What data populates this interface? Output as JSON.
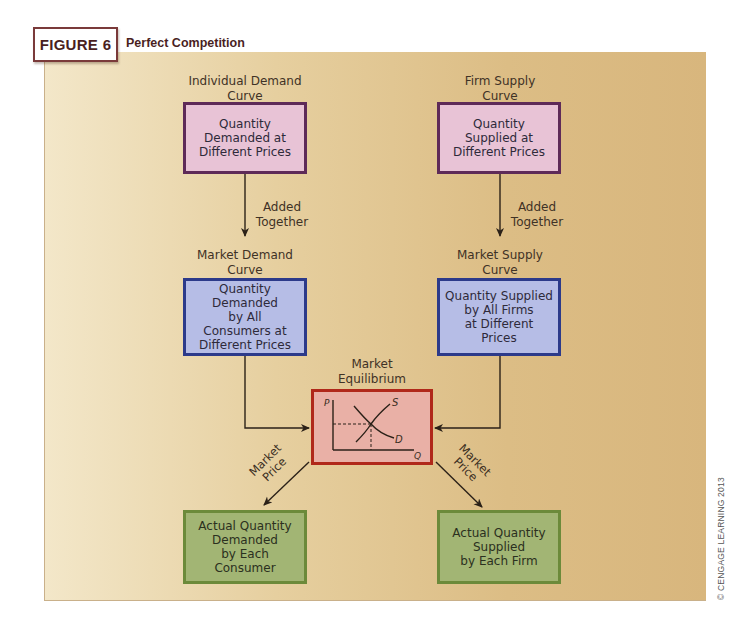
{
  "figure": {
    "number_label": "FIGURE 6",
    "title": "Perfect Competition"
  },
  "nodes": {
    "individual_demand": {
      "label": "Individual Demand\nCurve",
      "box_text": "Quantity\nDemanded at\nDifferent Prices"
    },
    "firm_supply": {
      "label": "Firm Supply\nCurve",
      "box_text": "Quantity\nSupplied at\nDifferent Prices"
    },
    "market_demand": {
      "label": "Market Demand\nCurve",
      "box_text": "Quantity Demanded\nby All\nConsumers at\nDifferent Prices"
    },
    "market_supply": {
      "label": "Market Supply\nCurve",
      "box_text": "Quantity Supplied\nby All Firms\nat Different\nPrices"
    },
    "market_equilibrium": {
      "label": "Market\nEquilibrium",
      "graph": {
        "y_axis": "P",
        "x_axis": "Q",
        "supply_label": "S",
        "demand_label": "D"
      }
    },
    "actual_demand": {
      "box_text": "Actual Quantity\nDemanded\nby Each Consumer"
    },
    "actual_supply": {
      "box_text": "Actual Quantity\nSupplied\nby Each Firm"
    }
  },
  "edges": {
    "demand_added": "Added\nTogether",
    "supply_added": "Added\nTogether",
    "price_left": "Market\nPrice",
    "price_right": "Market\nPrice"
  },
  "colors": {
    "individual_box": "#e8c3d6",
    "market_box": "#b6bde6",
    "equilibrium_box": "#e9b0a6",
    "actual_box": "#a2b574"
  },
  "credit": "© CENGAGE LEARNING 2013"
}
